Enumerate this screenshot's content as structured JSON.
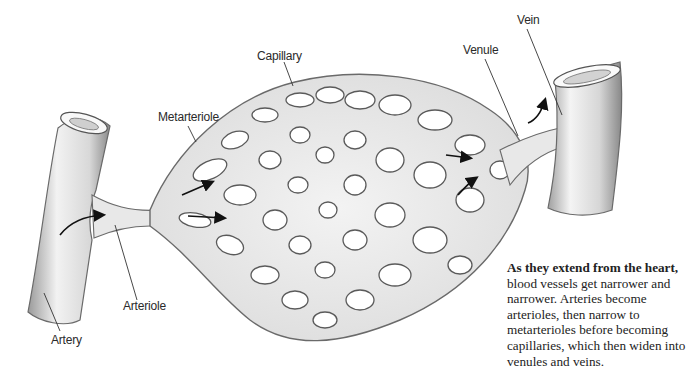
{
  "diagram": {
    "labels": {
      "artery": "Artery",
      "arteriole": "Arteriole",
      "metarteriole": "Metarteriole",
      "capillary": "Capillary",
      "venule": "Venule",
      "vein": "Vein"
    },
    "caption": {
      "lead": "As they extend from the heart,",
      "body": " blood vessels get narrower and narrower. Arteries become arterioles, then narrow to metarterioles before becoming capillaries, which then widen into venules and veins."
    },
    "colors": {
      "vessel_fill": "#e6e6e6",
      "vessel_stroke": "#6a6a6a",
      "arrow": "#111111",
      "leader_line": "#333333"
    }
  }
}
